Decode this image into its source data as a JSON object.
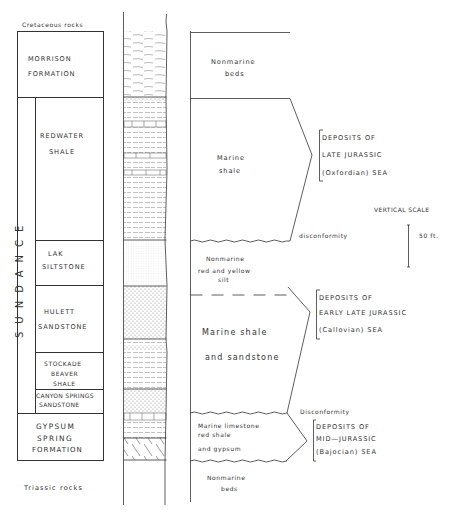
{
  "stratigraphic_column": {
    "top_context": "Cretaceous rocks",
    "bottom_context": "Triassic rocks",
    "group_name": "SUNDANCE",
    "units": [
      {
        "name_line1": "MORRISON",
        "name_line2": "FORMATION",
        "lithology": "Nonmarine beds"
      },
      {
        "name_line1": "REDWATER",
        "name_line2": "SHALE",
        "lithology": "Marine shale"
      },
      {
        "name_line1": "LAK",
        "name_line2": "SILTSTONE",
        "lithology": "Nonmarine red and yellow silt"
      },
      {
        "name_line1": "HULETT",
        "name_line2": "SANDSTONE",
        "lithology": "Marine shale and sandstone"
      },
      {
        "name_line1": "STOCKADE",
        "name_line2": "BEAVER",
        "name_line3": "SHALE"
      },
      {
        "name_line1": "CANYON SPRINGS",
        "name_line2": "SANDSTONE"
      },
      {
        "name_line1": "GYPSUM",
        "name_line2": "SPRING",
        "name_line3": "FORMATION",
        "lithology": "Marine limestone red shale and gypsum"
      }
    ]
  },
  "environments": {
    "nonmarine_top": {
      "line1": "Nonmarine",
      "line2": "beds"
    },
    "marine_shale": {
      "line1": "Marine",
      "line2": "shale"
    },
    "nonmarine_silt": {
      "line1": "Nonmarine",
      "line2": "red and yellow",
      "line3": "silt"
    },
    "marine_shale_sandstone": {
      "line1": "Marine shale",
      "line2": "and sandstone"
    },
    "marine_limestone": {
      "line1": "Marine limestone",
      "line2": "red shale",
      "line3": "and gypsum"
    },
    "nonmarine_bottom": {
      "line1": "Nonmarine",
      "line2": "beds"
    }
  },
  "unconformities": {
    "upper": "disconformity",
    "lower": "Disconformity"
  },
  "seas": [
    {
      "line1": "DEPOSITS   OF",
      "line2": "LATE   JURASSIC",
      "line3": "(Oxfordian)  SEA"
    },
    {
      "line1": "DEPOSITS   OF",
      "line2": "EARLY LATE JURASSIC",
      "line3": "(Callovian)  SEA"
    },
    {
      "line1": "DEPOSITS  OF",
      "line2": "MID—JURASSIC",
      "line3": "(Bajocian)  SEA"
    }
  ],
  "scale": {
    "title": "VERTICAL SCALE",
    "value": "50 ft."
  }
}
